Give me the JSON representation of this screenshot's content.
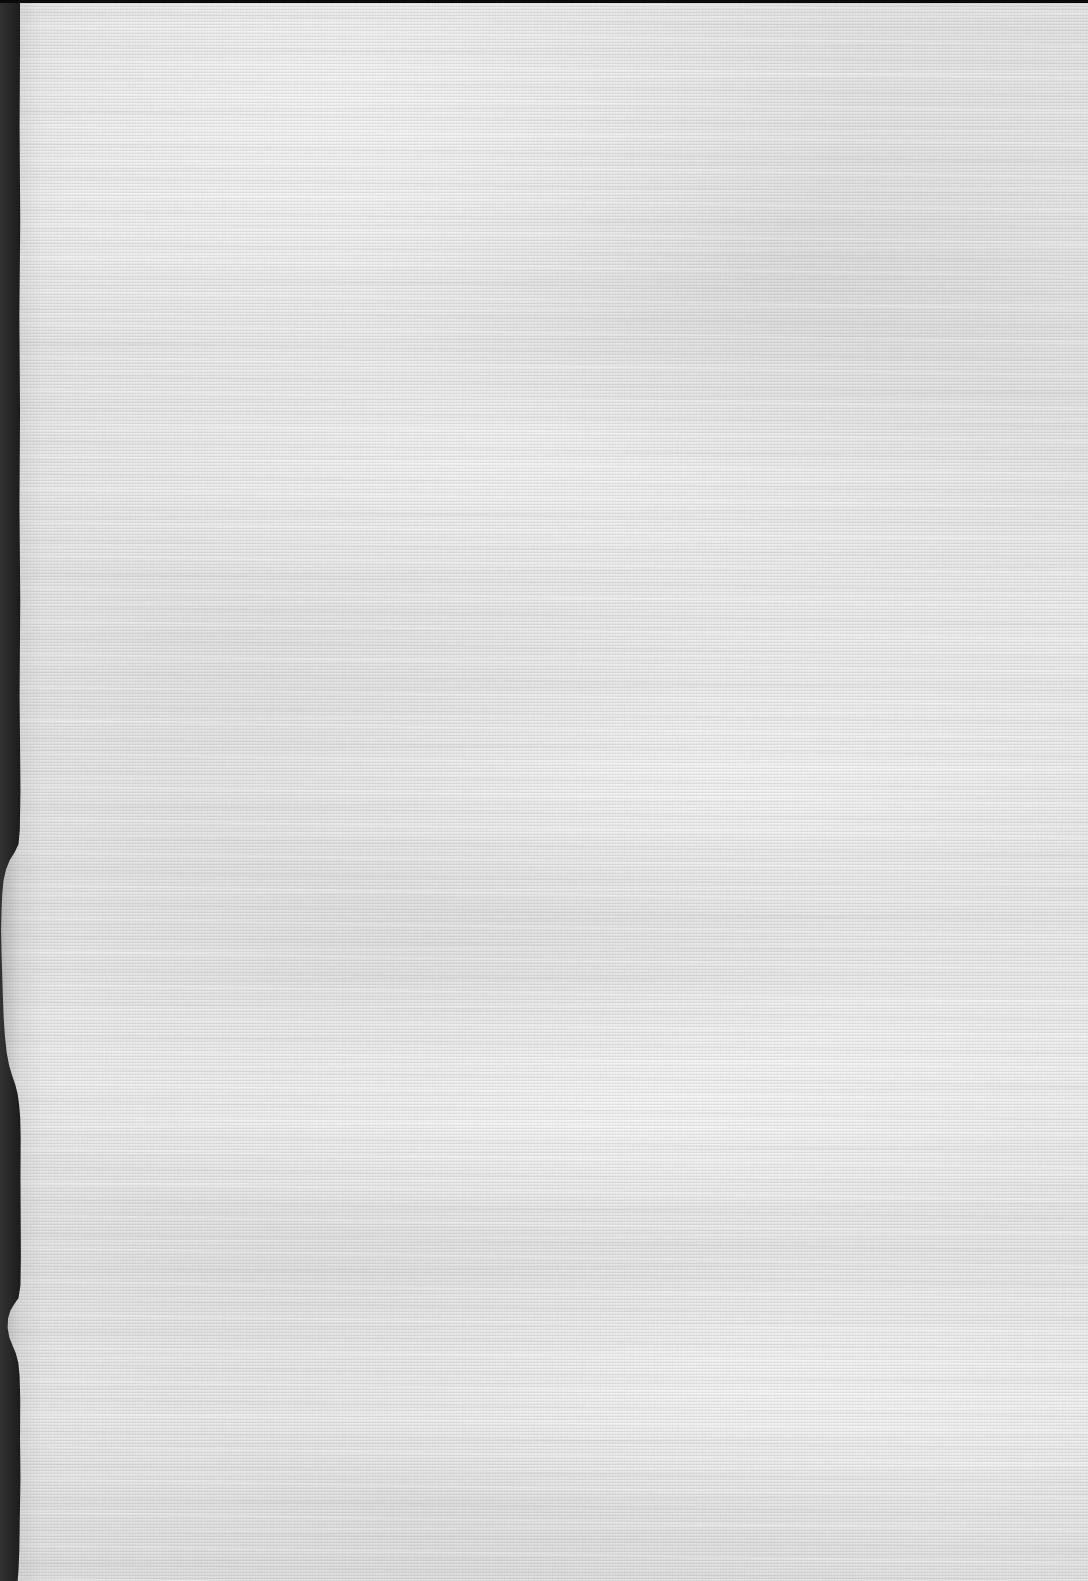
{
  "document": {
    "title": "Scanned blank page",
    "kind": "scanned-page-image",
    "page_text": "",
    "has_text": false,
    "orientation": "portrait"
  },
  "canvas": {
    "width_px": 1088,
    "height_px": 1581,
    "background_color": "#000000"
  },
  "paper": {
    "name": "textured-laid-paper-sheet",
    "base_color": "#ebebeb",
    "highlight_color": "#f6f6f6",
    "shadow_color": "#dcdcdc",
    "texture": "fine horizontal laid lines with cloudy mottling",
    "laid_line_period_px": 3
  },
  "edges": {
    "left": {
      "name": "torn-left-edge",
      "description": "irregular deckle / torn paper edge against black scanner background",
      "band_color": "#000000",
      "nominal_width_px": 20,
      "min_width_px": 1,
      "max_width_px": 22
    },
    "top": {
      "name": "top-scanner-strip",
      "color": "#0a0a0a",
      "height_px": 3
    },
    "right": {
      "name": "right-bleed-edge",
      "description": "paper runs off the image edge"
    },
    "bottom": {
      "name": "bottom-bleed-edge",
      "description": "paper runs off the image edge"
    }
  }
}
